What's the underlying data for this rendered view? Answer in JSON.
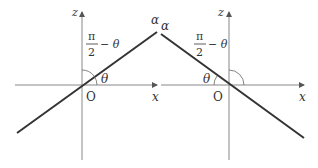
{
  "diagrams": [
    {
      "id": "left",
      "axis_z_label": "z",
      "axis_x_label": "x",
      "origin_label": "O",
      "line_label": "α",
      "angle_theta_label": "θ",
      "angle_complement": {
        "numerator": "π",
        "denominator": "2",
        "suffix": "− θ"
      }
    },
    {
      "id": "right",
      "axis_z_label": "z",
      "axis_x_label": "x",
      "origin_label": "O",
      "line_label": "α",
      "angle_theta_label": "θ",
      "angle_complement": {
        "numerator": "π",
        "denominator": "2",
        "suffix": "− θ"
      }
    }
  ],
  "colors": {
    "line": "#333333",
    "axis": "#777777",
    "text": "#333333"
  }
}
